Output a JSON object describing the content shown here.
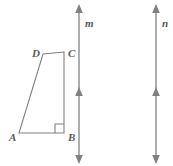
{
  "figure": {
    "type": "geometry-diagram",
    "background_color": "#ffffff",
    "stroke_color": "#808080",
    "label_color": "#5a5a5a",
    "polygon": {
      "name": "quadrilateral-abcd",
      "vertices": [
        {
          "label": "A",
          "x": 19,
          "y": 133,
          "label_x": 9,
          "label_y": 141
        },
        {
          "label": "B",
          "x": 64,
          "y": 133,
          "label_x": 68,
          "label_y": 141
        },
        {
          "label": "C",
          "x": 64,
          "y": 52,
          "label_x": 68,
          "label_y": 57
        },
        {
          "label": "D",
          "x": 43,
          "y": 54,
          "label_x": 32,
          "label_y": 57
        }
      ],
      "points_attr": "19,133 64,133 64,52 43,54",
      "right_angle": {
        "at_vertex": "B",
        "marker": "square",
        "points_attr": "55,133 55,124 64,124"
      }
    },
    "lines": [
      {
        "label": "m",
        "name": "line-m",
        "x": 79,
        "y_top": 8,
        "y_bottom": 161,
        "label_x": 85,
        "label_y": 27,
        "arrowheads": [
          {
            "position": "top",
            "y": 8,
            "direction": "up"
          },
          {
            "position": "middle",
            "y": 95,
            "direction": "up"
          },
          {
            "position": "bottom",
            "y": 161,
            "direction": "down"
          }
        ]
      },
      {
        "label": "n",
        "name": "line-n",
        "x": 156,
        "y_top": 8,
        "y_bottom": 161,
        "label_x": 162,
        "label_y": 27,
        "arrowheads": [
          {
            "position": "top",
            "y": 8,
            "direction": "up"
          },
          {
            "position": "middle",
            "y": 95,
            "direction": "up"
          },
          {
            "position": "bottom",
            "y": 161,
            "direction": "down"
          }
        ]
      }
    ]
  }
}
